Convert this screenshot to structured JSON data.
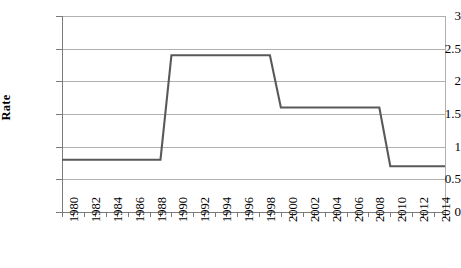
{
  "chart_data": {
    "type": "line",
    "title": "",
    "xlabel": "",
    "ylabel": "Rate",
    "xlim": [
      1980,
      2015
    ],
    "ylim": [
      0,
      3
    ],
    "ytick_labels": [
      "3",
      "2.5",
      "2",
      "1.5",
      "1",
      "0.5",
      "0"
    ],
    "ytick_values": [
      3,
      2.5,
      2,
      1.5,
      1,
      0.5,
      0
    ],
    "xtick_labels": [
      "1980",
      "1982",
      "1984",
      "1986",
      "1988",
      "1990",
      "1992",
      "1994",
      "1996",
      "1998",
      "2000",
      "2002",
      "2004",
      "2006",
      "2008",
      "2010",
      "2012",
      "2014"
    ],
    "xtick_values": [
      1980,
      1982,
      1984,
      1986,
      1988,
      1990,
      1992,
      1994,
      1996,
      1998,
      2000,
      2002,
      2004,
      2006,
      2008,
      2010,
      2012,
      2014
    ],
    "minor_tick_step": 1,
    "grid": "horizontal",
    "legend": "none",
    "line_color": "#595959",
    "series": [
      {
        "name": "Rate",
        "x": [
          1980,
          1981,
          1982,
          1983,
          1984,
          1985,
          1986,
          1987,
          1988,
          1989,
          1990,
          1991,
          1992,
          1993,
          1994,
          1995,
          1996,
          1997,
          1998,
          1999,
          2000,
          2001,
          2002,
          2003,
          2004,
          2005,
          2006,
          2007,
          2008,
          2009,
          2010,
          2011,
          2012,
          2013,
          2014,
          2015
        ],
        "values": [
          0.8,
          0.8,
          0.8,
          0.8,
          0.8,
          0.8,
          0.8,
          0.8,
          0.8,
          0.8,
          2.4,
          2.4,
          2.4,
          2.4,
          2.4,
          2.4,
          2.4,
          2.4,
          2.4,
          2.4,
          1.6,
          1.6,
          1.6,
          1.6,
          1.6,
          1.6,
          1.6,
          1.6,
          1.6,
          1.6,
          0.7,
          0.7,
          0.7,
          0.7,
          0.7,
          0.7
        ]
      }
    ],
    "plateaus": [
      {
        "value": 0.8,
        "from": 1980,
        "to": 1989
      },
      {
        "value": 2.4,
        "from": 1990,
        "to": 1999
      },
      {
        "value": 1.6,
        "from": 2000,
        "to": 2009
      },
      {
        "value": 0.7,
        "from": 2010,
        "to": 2015
      }
    ]
  }
}
